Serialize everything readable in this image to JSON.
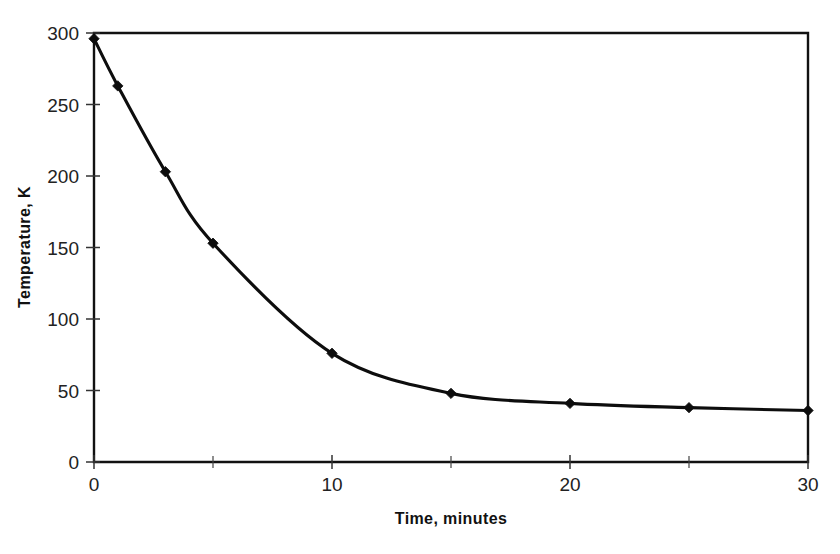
{
  "chart_data": {
    "type": "line",
    "title": "",
    "xlabel": "Time, minutes",
    "ylabel": "Temperature, K",
    "xlim": [
      0,
      30
    ],
    "ylim": [
      0,
      300
    ],
    "grid": false,
    "legend": false,
    "legend_position": "none",
    "x_ticks": [
      0,
      10,
      20,
      30
    ],
    "x_tick_labels": [
      "0",
      "10",
      "20",
      "30"
    ],
    "x_minor_ticks": [
      5,
      15,
      25
    ],
    "y_ticks": [
      0,
      50,
      100,
      150,
      200,
      250,
      300
    ],
    "y_tick_labels": [
      "0",
      "50",
      "100",
      "150",
      "200",
      "250",
      "300"
    ],
    "marker": "diamond",
    "line_color": "#0d0d0d",
    "marker_color": "#0d0d0d",
    "x": [
      0,
      1,
      3,
      5,
      10,
      15,
      20,
      25,
      30
    ],
    "series": [
      {
        "name": "Temperature",
        "values": [
          296,
          263,
          203,
          153,
          76,
          48,
          41,
          38,
          36
        ]
      }
    ]
  },
  "axes": {
    "x_title": "Time, minutes",
    "y_title": "Temperature, K",
    "x_tick_0": "0",
    "x_tick_1": "10",
    "x_tick_2": "20",
    "x_tick_3": "30",
    "y_tick_0": "0",
    "y_tick_1": "50",
    "y_tick_2": "100",
    "y_tick_3": "150",
    "y_tick_4": "200",
    "y_tick_5": "250",
    "y_tick_6": "300"
  }
}
